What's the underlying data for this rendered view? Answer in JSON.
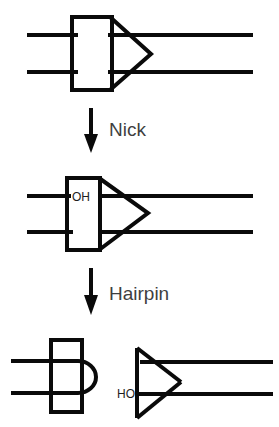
{
  "figure": {
    "background_color": "#ffffff",
    "stroke_color": "#0a0a0a",
    "label_color": "#3f3f3f",
    "width": 279,
    "height": 427
  },
  "steps": [
    {
      "id": "step-nick",
      "label": "Nick",
      "arrow": "down-arrow"
    },
    {
      "id": "step-hairpin",
      "label": "Hairpin",
      "arrow": "down-arrow"
    }
  ],
  "panels": [
    {
      "id": "panel-top",
      "name": "intact-duplex",
      "description": "Duplex DNA with box and chevron motif",
      "labels": []
    },
    {
      "id": "panel-middle",
      "name": "nicked-duplex",
      "description": "Nicked duplex with free hydroxyl",
      "labels": [
        "OH"
      ]
    },
    {
      "id": "panel-bottom",
      "name": "hairpin-products",
      "description": "Hairpin loop product and cleaved end with hydroxyl",
      "labels": [
        "HO"
      ]
    }
  ],
  "annotations": {
    "hydroxyl_top": "OH",
    "hydroxyl_bottom": "HO"
  },
  "arrow_labels": {
    "first": "Nick",
    "second": "Hairpin"
  }
}
